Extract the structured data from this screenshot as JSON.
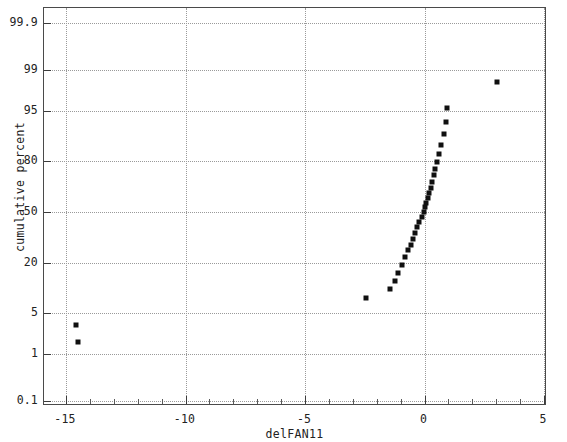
{
  "chart_data": {
    "type": "scatter",
    "title": "",
    "subtitle": "",
    "xlabel": "delFAN11",
    "ylabel": "cumulative percent",
    "xlim": [
      -16.0,
      5.1
    ],
    "ylim_percent": [
      0.1,
      99.9
    ],
    "grid": true,
    "legend": "none",
    "yscale": "normal-probability",
    "xticks": [
      -15,
      -10,
      -5,
      0,
      5
    ],
    "xtick_labels": [
      "-15",
      "-10",
      "-5",
      "0",
      "5"
    ],
    "x_minor_tick_step": 1,
    "yticks": [
      0.1,
      1,
      5,
      20,
      50,
      80,
      95,
      99,
      99.9
    ],
    "ytick_labels": [
      "0.1",
      "1",
      "5",
      "20",
      "50",
      "80",
      "95",
      "99",
      "99.9"
    ],
    "marker": "square",
    "marker_color": "#101010",
    "marker_size_px": 5,
    "series": [
      {
        "name": "delFAN11",
        "points": [
          {
            "x": -14.6,
            "y": 3.2
          },
          {
            "x": -14.5,
            "y": 1.7
          },
          {
            "x": -2.45,
            "y": 8.0
          },
          {
            "x": -1.45,
            "y": 10.5
          },
          {
            "x": -1.25,
            "y": 13.0
          },
          {
            "x": -1.1,
            "y": 16.0
          },
          {
            "x": -0.95,
            "y": 19.5
          },
          {
            "x": -0.8,
            "y": 23.0
          },
          {
            "x": -0.68,
            "y": 26.5
          },
          {
            "x": -0.58,
            "y": 29.5
          },
          {
            "x": -0.48,
            "y": 33.0
          },
          {
            "x": -0.4,
            "y": 36.5
          },
          {
            "x": -0.3,
            "y": 40.0
          },
          {
            "x": -0.22,
            "y": 43.5
          },
          {
            "x": -0.12,
            "y": 47.0
          },
          {
            "x": -0.04,
            "y": 50.0
          },
          {
            "x": 0.02,
            "y": 53.0
          },
          {
            "x": 0.08,
            "y": 56.0
          },
          {
            "x": 0.14,
            "y": 59.0
          },
          {
            "x": 0.2,
            "y": 62.0
          },
          {
            "x": 0.26,
            "y": 65.5
          },
          {
            "x": 0.32,
            "y": 69.0
          },
          {
            "x": 0.38,
            "y": 72.5
          },
          {
            "x": 0.45,
            "y": 76.0
          },
          {
            "x": 0.52,
            "y": 79.5
          },
          {
            "x": 0.6,
            "y": 83.0
          },
          {
            "x": 0.7,
            "y": 86.5
          },
          {
            "x": 0.8,
            "y": 90.0
          },
          {
            "x": 0.92,
            "y": 93.0
          },
          {
            "x": 0.95,
            "y": 95.5
          },
          {
            "x": 3.05,
            "y": 98.3
          }
        ]
      }
    ]
  }
}
